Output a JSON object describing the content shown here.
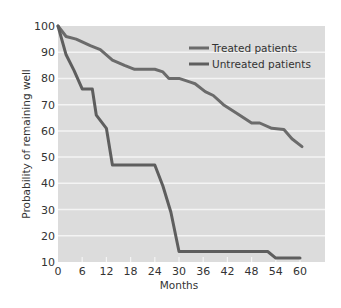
{
  "chart_data": {
    "type": "line",
    "title": "",
    "xlabel": "Months",
    "ylabel": "Probability of remaining well",
    "xlim": [
      0,
      66
    ],
    "ylim": [
      10,
      100
    ],
    "xticks": [
      0,
      6,
      12,
      18,
      24,
      30,
      36,
      42,
      48,
      54,
      60
    ],
    "yticks": [
      10,
      20,
      30,
      40,
      50,
      60,
      70,
      80,
      90,
      100
    ],
    "grid": "horizontal",
    "legend_position": "top-right",
    "background": "#dcdcdc",
    "series": [
      {
        "name": "Treated patients",
        "color": "#6b6b6b",
        "x": [
          0,
          2,
          4.5,
          8,
          10.5,
          13.5,
          16.5,
          19,
          24,
          26,
          27.5,
          30,
          33,
          34,
          36.5,
          38.5,
          41,
          44,
          46.5,
          48,
          50,
          53,
          56,
          58,
          60.5
        ],
        "y": [
          100,
          96,
          95,
          92.5,
          91,
          87,
          85,
          83.5,
          83.5,
          82.5,
          80,
          80,
          78.5,
          78,
          75,
          73.5,
          70,
          67,
          64.5,
          63,
          63,
          61,
          60.5,
          57,
          54
        ]
      },
      {
        "name": "Untreated patients",
        "color": "#5e5e5e",
        "x": [
          0,
          2,
          4,
          6,
          8.5,
          9.5,
          12,
          13.5,
          24,
          26,
          28,
          30,
          52,
          54,
          60
        ],
        "y": [
          100,
          89,
          83,
          76,
          76,
          66,
          61,
          47,
          47,
          39,
          29,
          14,
          14,
          11.5,
          11.5
        ]
      }
    ]
  }
}
